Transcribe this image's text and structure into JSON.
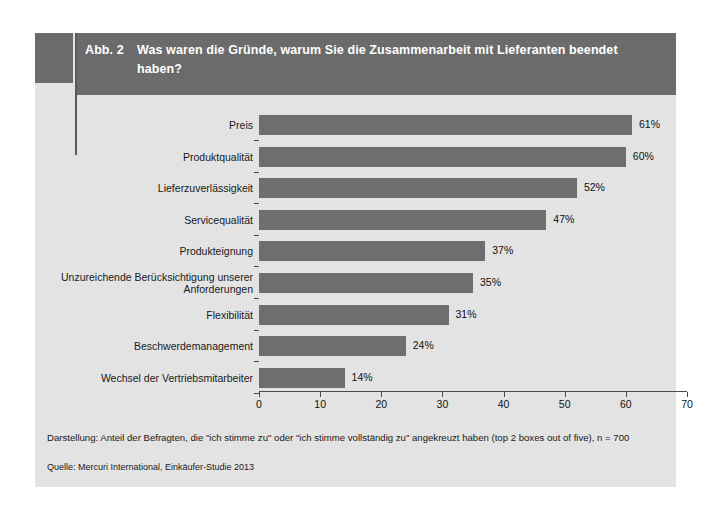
{
  "figure": {
    "number": "Abb. 2",
    "title": "Was waren die Gründe, warum Sie die Zusammenarbeit mit Lieferanten beendet haben?",
    "footnote": "Darstellung: Anteil der Befragten, die \"ich stimme zu\" oder \"ich stimme vollständig zu\" angekreuzt haben (top 2 boxes out of five), n = 700",
    "source": "Quelle: Mercuri International, Einkäufer-Studie 2013"
  },
  "colors": {
    "bar": "#6e6e6e",
    "panel": "#e3e3e3",
    "header": "#6b6b6b",
    "axis": "#4a4a4a",
    "text": "#1a1a1a"
  },
  "chart_data": {
    "type": "bar",
    "orientation": "horizontal",
    "title": "Was waren die Gründe, warum Sie die Zusammenarbeit mit Lieferanten beendet haben?",
    "xlabel": "",
    "ylabel": "",
    "xlim": [
      0,
      70
    ],
    "xticks": [
      0,
      10,
      20,
      30,
      40,
      50,
      60,
      70
    ],
    "xtick_labels": [
      "0",
      "10",
      "20",
      "30",
      "40",
      "50",
      "60",
      "70"
    ],
    "grid": false,
    "legend": null,
    "value_suffix": "%",
    "categories": [
      "Preis",
      "Produktqualität",
      "Lieferzuverlässigkeit",
      "Servicequalität",
      "Produkteignung",
      "Unzureichende Berücksichtigung unserer Anforderungen",
      "Flexibilität",
      "Beschwerdemanagement",
      "Wechsel der Vertriebsmitarbeiter"
    ],
    "values": [
      61,
      60,
      52,
      47,
      37,
      35,
      31,
      24,
      14
    ],
    "data_labels": [
      "61%",
      "60%",
      "52%",
      "47%",
      "37%",
      "35%",
      "31%",
      "24%",
      "14%"
    ]
  }
}
